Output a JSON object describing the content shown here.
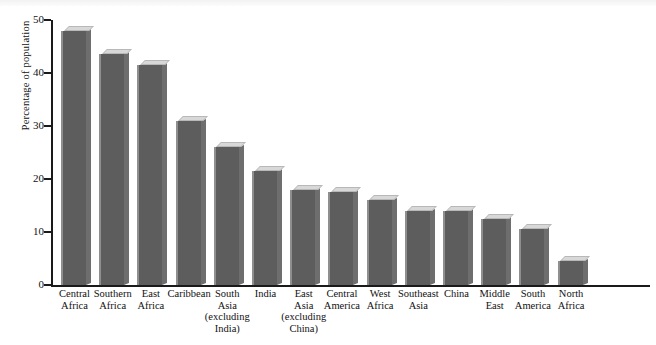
{
  "chart_data": {
    "type": "bar",
    "title": "",
    "subtitle": "",
    "xlabel": "",
    "ylabel": "Percentage of population",
    "ylim": [
      0,
      50
    ],
    "yticks": [
      0,
      10,
      20,
      30,
      40,
      50
    ],
    "ytick_labels": [
      "0",
      "10",
      "20",
      "30",
      "40",
      "50"
    ],
    "grid": false,
    "legend": null,
    "legend_position": "none",
    "annotations": [],
    "bar_style": "3d-extruded",
    "orientation": "vertical",
    "categories": [
      "Central Africa",
      "Southern Africa",
      "East Africa",
      "Caribbean",
      "South Asia (excluding India)",
      "India",
      "East Asia (excluding China)",
      "Central America",
      "West Africa",
      "Southeast Asia",
      "China",
      "Middle East",
      "South America",
      "North Africa"
    ],
    "category_lines": [
      [
        "Central",
        "Africa"
      ],
      [
        "Southern",
        "Africa"
      ],
      [
        "East",
        "Africa"
      ],
      [
        "Caribbean"
      ],
      [
        "South",
        "Asia",
        "(excluding",
        "India)"
      ],
      [
        "India"
      ],
      [
        "East",
        "Asia",
        "(excluding",
        "China)"
      ],
      [
        "Central",
        "America"
      ],
      [
        "West",
        "Africa"
      ],
      [
        "Southeast",
        "Asia"
      ],
      [
        "China"
      ],
      [
        "Middle",
        "East"
      ],
      [
        "South",
        "America"
      ],
      [
        "North",
        "Africa"
      ]
    ],
    "values": [
      48,
      43.5,
      41.5,
      31,
      26,
      21.5,
      18,
      17.5,
      16,
      14,
      14,
      12.5,
      10.5,
      4.5
    ]
  },
  "colors": {
    "bar_front": "#5d5d5d",
    "bar_side": "#6e6e6e",
    "bar_top": "#d8d8d8",
    "bar_highlight": "#8f8f8f",
    "axis": "#1a1a1a",
    "text": "#111111",
    "background": "#ffffff"
  }
}
